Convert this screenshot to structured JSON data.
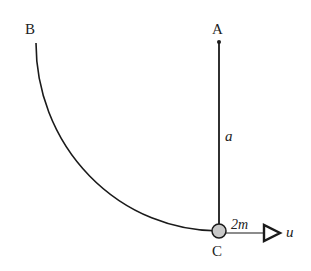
{
  "diagram": {
    "points": {
      "A": {
        "label": "A",
        "x": 219,
        "y": 42
      },
      "B": {
        "label": "B",
        "x": 36,
        "y": 43
      },
      "C": {
        "label": "C",
        "x": 219,
        "y": 231
      }
    },
    "rod_length_label": "a",
    "mass_label": "2m",
    "velocity_label": "u",
    "colors": {
      "line": "#1a1a1a",
      "particle_fill": "#c8c8c8",
      "background": "#ffffff"
    }
  }
}
